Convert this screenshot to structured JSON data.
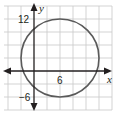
{
  "diagram": {
    "type": "coordinate-plane-circle",
    "axes": {
      "x_label": "x",
      "y_label": "y",
      "units_per_grid": 3
    },
    "tick_labels": {
      "x_6": "6",
      "y_12": "12",
      "y_neg6": "−6"
    },
    "circle": {
      "center": [
        6,
        3
      ],
      "radius": 9
    },
    "colors": {
      "grid": "#c8c8c8",
      "axis": "#231f20",
      "circle": "#5a5a5a"
    }
  }
}
